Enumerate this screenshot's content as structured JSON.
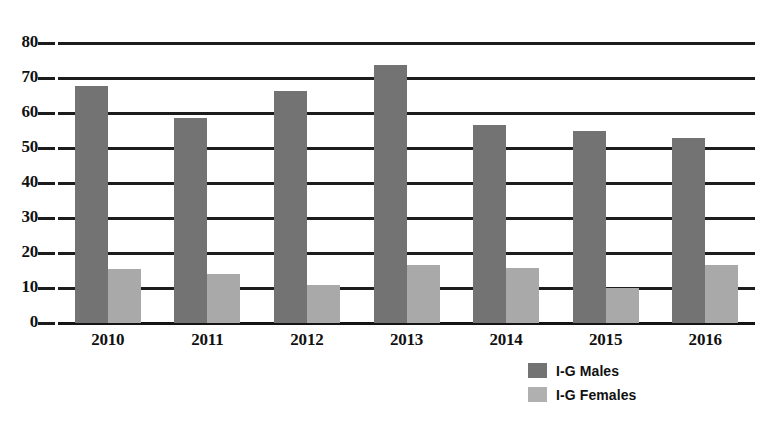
{
  "chart_data": {
    "type": "bar",
    "title": "",
    "subtitle": "",
    "xlabel": "",
    "ylabel": "",
    "categories": [
      "2010",
      "2011",
      "2012",
      "2013",
      "2014",
      "2015",
      "2016"
    ],
    "series": [
      {
        "name": "I-G Males",
        "color": "#737373",
        "values": [
          67.7,
          58.6,
          66.2,
          73.8,
          56.5,
          55.0,
          53.0
        ]
      },
      {
        "name": "I-G Females",
        "color": "#a9a9a9",
        "values": [
          15.5,
          14.0,
          11.0,
          16.7,
          15.7,
          10.0,
          16.6
        ]
      }
    ],
    "ylim": [
      0,
      80
    ],
    "ytick_labels": [
      "0",
      "10",
      "20",
      "30",
      "40",
      "50",
      "60",
      "70",
      "80"
    ],
    "ytick_values": [
      0,
      10,
      20,
      30,
      40,
      50,
      60,
      70,
      80
    ],
    "grid": true,
    "grid_axis": "y",
    "legend_position": "bottom-center",
    "legend": [
      "I-G Males",
      "I-G Females"
    ],
    "annotations": []
  },
  "legend": {
    "items": [
      {
        "label": "I-G Males",
        "swatch": "legend-swatch-males"
      },
      {
        "label": "I-G Females",
        "swatch": "legend-swatch-females"
      }
    ]
  },
  "colors": {
    "males": "#737373",
    "females": "#a9a9a9",
    "gridline": "#1c1c1c",
    "text": "#111111",
    "background": "#ffffff"
  }
}
